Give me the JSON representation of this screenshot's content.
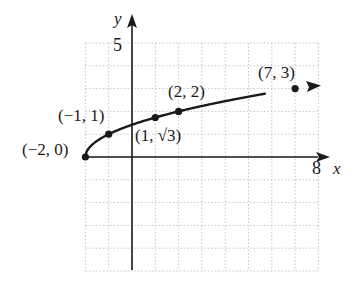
{
  "chart_data": {
    "type": "line",
    "title": "",
    "function": "y = sqrt(x + 2)",
    "xlabel": "x",
    "ylabel": "y",
    "xlim": [
      -2,
      8
    ],
    "ylim": [
      -5,
      5
    ],
    "grid": true,
    "grid_style": "dotted",
    "tick_labels": {
      "x": [
        "8"
      ],
      "y": [
        "5"
      ]
    },
    "series": [
      {
        "name": "y = sqrt(x+2)",
        "points": [
          {
            "x": -2,
            "y": 0,
            "label": "(−2, 0)"
          },
          {
            "x": -1,
            "y": 1,
            "label": "(−1, 1)"
          },
          {
            "x": 1,
            "y": 1.732,
            "label": "(1, √3)"
          },
          {
            "x": 2,
            "y": 2,
            "label": "(2, 2)"
          },
          {
            "x": 7,
            "y": 3,
            "label": "(7, 3)"
          }
        ],
        "arrow_end": true
      }
    ],
    "legend": null
  },
  "labels": {
    "x_axis": "x",
    "y_axis": "y",
    "x_tick_max": "8",
    "y_tick_max": "5",
    "p0": "(−2, 0)",
    "p1": "(−1, 1)",
    "p2": "(1, √3)",
    "p3": "(2, 2)",
    "p4": "(7, 3)"
  },
  "colors": {
    "ink": "#1a1a1a",
    "grid": "#b8b8b8",
    "background": "#ffffff"
  }
}
